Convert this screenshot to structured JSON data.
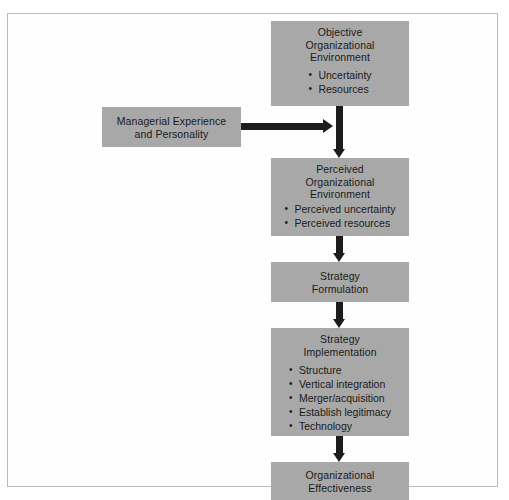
{
  "figure": {
    "type": "flow-diagram",
    "orientation": "top-to-bottom",
    "background": "#ffffff",
    "node_fill": "#a8a8a8",
    "arrow_color": "#1c1c1c",
    "border_color": "#b9b9b9"
  },
  "nodes": {
    "objective_environment": {
      "title": "Objective\nOrganizational\nEnvironment",
      "bullets": [
        "Uncertainty",
        "Resources"
      ]
    },
    "managerial_experience": {
      "title": "Managerial Experience\nand Personality",
      "bullets": []
    },
    "perceived_environment": {
      "title": "Perceived\nOrganizational\nEnvironment",
      "bullets": [
        "Perceived uncertainty",
        "Perceived resources"
      ]
    },
    "strategy_formulation": {
      "title": "Strategy\nFormulation",
      "bullets": []
    },
    "strategy_implementation": {
      "title": "Strategy\nImplementation",
      "bullets": [
        "Structure",
        "Vertical integration",
        "Merger/acquisition",
        "Establish legitimacy",
        "Technology"
      ]
    },
    "organizational_effectiveness": {
      "title": "Organizational\nEffectiveness",
      "bullets": []
    }
  },
  "connectors": [
    {
      "id": "objective-to-perceived",
      "from": "objective_environment",
      "to": "perceived_environment",
      "direction": "down"
    },
    {
      "id": "managerial-to-flow",
      "from": "managerial_experience",
      "to": "objective-to-perceived",
      "direction": "right"
    },
    {
      "id": "perceived-to-formulation",
      "from": "perceived_environment",
      "to": "strategy_formulation",
      "direction": "down"
    },
    {
      "id": "formulation-to-implementation",
      "from": "strategy_formulation",
      "to": "strategy_implementation",
      "direction": "down"
    },
    {
      "id": "implementation-to-effectiveness",
      "from": "strategy_implementation",
      "to": "organizational_effectiveness",
      "direction": "down"
    }
  ]
}
